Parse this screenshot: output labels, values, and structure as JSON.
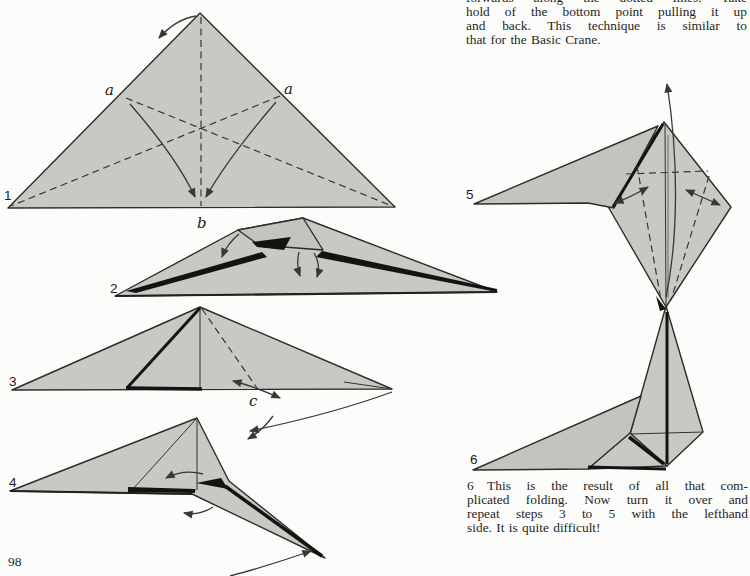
{
  "page_number": "98",
  "colors": {
    "paper_background": "#fcfcfa",
    "origami_fill": "#c9c8c5",
    "origami_fill_shaded": "#c4c3c0",
    "line_ink": "#2e2c29",
    "fold_black": "#141311"
  },
  "paragraph_top": {
    "lines": [
      "forwards along the dotted lines. Take",
      "hold of the bottom point pulling it up",
      "and back. This technique is similar to",
      "that for the Basic Crane."
    ]
  },
  "paragraph_step6": {
    "lines": [
      "6 This is the result of all that com-",
      "plicated folding. Now turn it over and",
      "repeat steps 3 to 5 with the lefthand",
      "side. It is quite difficult!"
    ]
  },
  "labels": {
    "step1": "1",
    "step2": "2",
    "step3": "3",
    "step4": "4",
    "step5": "5",
    "step6": "6",
    "a_left": "a",
    "a_right": "a",
    "b": "b",
    "c": "c"
  }
}
